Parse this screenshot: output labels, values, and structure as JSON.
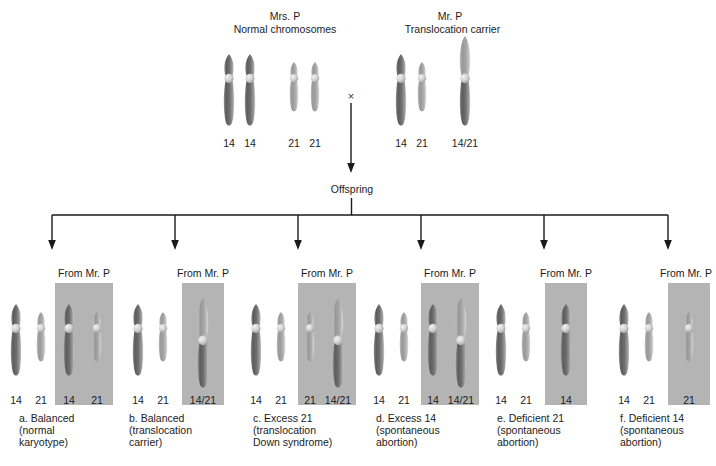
{
  "diagram": {
    "title_hidden": "",
    "parents": [
      {
        "id": "mother",
        "name": "Mrs. P",
        "status": "Normal chromosomes",
        "chromosomes": [
          {
            "type": "14",
            "label": "14"
          },
          {
            "type": "14",
            "label": "14"
          },
          {
            "type": "21",
            "label": "21"
          },
          {
            "type": "21",
            "label": "21"
          }
        ]
      },
      {
        "id": "father",
        "name": "Mr. P",
        "status": "Translocation carrier",
        "chromosomes": [
          {
            "type": "14",
            "label": "14"
          },
          {
            "type": "21",
            "label": "21"
          },
          {
            "type": "1421",
            "label": "14/21"
          }
        ]
      }
    ],
    "cross_symbol": "×",
    "offspring_label": "Offspring",
    "from_father_label": "From Mr. P",
    "offspring": [
      {
        "key": "a",
        "from_mother": [
          {
            "type": "14",
            "label": "14"
          },
          {
            "type": "21",
            "label": "21"
          }
        ],
        "from_father": [
          {
            "type": "14",
            "label": "14"
          },
          {
            "type": "21",
            "label": "21"
          }
        ],
        "caption": "a. Balanced\n(normal\nkaryotype)"
      },
      {
        "key": "b",
        "from_mother": [
          {
            "type": "14",
            "label": "14"
          },
          {
            "type": "21",
            "label": "21"
          }
        ],
        "from_father": [
          {
            "type": "1421",
            "label": "14/21"
          }
        ],
        "caption": "b. Balanced\n(translocation\ncarrier)"
      },
      {
        "key": "c",
        "from_mother": [
          {
            "type": "14",
            "label": "14"
          },
          {
            "type": "21",
            "label": "21"
          }
        ],
        "from_father": [
          {
            "type": "21",
            "label": "21"
          },
          {
            "type": "1421",
            "label": "14/21"
          }
        ],
        "caption": "c. Excess 21\n(translocation\nDown syndrome)"
      },
      {
        "key": "d",
        "from_mother": [
          {
            "type": "14",
            "label": "14"
          },
          {
            "type": "21",
            "label": "21"
          }
        ],
        "from_father": [
          {
            "type": "14",
            "label": "14"
          },
          {
            "type": "1421",
            "label": "14/21"
          }
        ],
        "caption": "d. Excess 14\n(spontaneous\nabortion)"
      },
      {
        "key": "e",
        "from_mother": [
          {
            "type": "14",
            "label": "14"
          },
          {
            "type": "21",
            "label": "21"
          }
        ],
        "from_father": [
          {
            "type": "14",
            "label": "14"
          }
        ],
        "caption": "e. Deficient 21\n(spontaneous\nabortion)"
      },
      {
        "key": "f",
        "from_mother": [
          {
            "type": "14",
            "label": "14"
          },
          {
            "type": "21",
            "label": "21"
          }
        ],
        "from_father": [
          {
            "type": "21",
            "label": "21"
          }
        ],
        "caption": "f. Deficient 14\n(spontaneous\nabortion)"
      }
    ],
    "colors": {
      "chr14_dark": "#6f6f6f",
      "chr21_light": "#a8a8a8",
      "band_gray": "#b4b4b4",
      "line": "#1a1a1a",
      "background": "#ffffff"
    }
  }
}
